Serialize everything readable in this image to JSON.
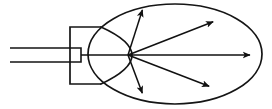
{
  "figure": {
    "background_color": "#ffffff",
    "stroke_color": "#151515",
    "canvas": {
      "width": 272,
      "height": 109
    }
  },
  "geometry": {
    "stem": {
      "name": "shaft",
      "x_start": 10,
      "x_end": 81,
      "y_top": 48,
      "y_bottom": 62
    },
    "head_rect": {
      "name": "emitter-body",
      "x_left": 70,
      "x_right": 101,
      "y_top": 27,
      "y_bottom": 84
    },
    "neck_curve": {
      "name": "emitter-tip",
      "start": [
        101,
        27
      ],
      "control": [
        163,
        55
      ],
      "end": [
        101,
        84
      ],
      "apex_x": 130
    },
    "ellipse": {
      "name": "dispersion-field",
      "cx": 175,
      "cy": 54,
      "rx": 87,
      "ry": 50
    },
    "origin": {
      "x": 128,
      "y": 55
    }
  },
  "rays": [
    {
      "name": "ray-upper-left",
      "tip_x": 143,
      "tip_y": 8,
      "angle_deg": -72
    },
    {
      "name": "ray-upper-right",
      "tip_x": 215,
      "tip_y": 21,
      "angle_deg": -21
    },
    {
      "name": "ray-axis",
      "tip_x": 252,
      "tip_y": 55,
      "angle_deg": 0
    },
    {
      "name": "ray-lower-right",
      "tip_x": 211,
      "tip_y": 87,
      "angle_deg": 21
    },
    {
      "name": "ray-lower-left",
      "tip_x": 143,
      "tip_y": 95,
      "angle_deg": 71
    }
  ],
  "labels": {
    "annotations": []
  }
}
